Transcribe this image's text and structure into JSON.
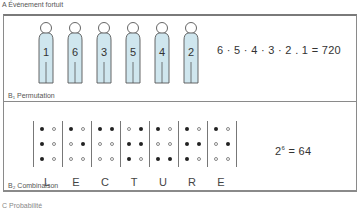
{
  "section_a": {
    "label": "A   Événement fortuit"
  },
  "permutation": {
    "label": "B₁  Permutation",
    "figures": [
      {
        "number": "1",
        "x": 35
      },
      {
        "number": "6",
        "x": 64
      },
      {
        "number": "3",
        "x": 93
      },
      {
        "number": "5",
        "x": 122
      },
      {
        "number": "4",
        "x": 151
      },
      {
        "number": "2",
        "x": 180
      }
    ],
    "formula": "6 · 5 · 4 · 3 · 2 . 1 = 720",
    "figure_color": "#cfe6ee"
  },
  "combination": {
    "label": "B₂  Combinaison",
    "formula_base": "2",
    "formula_exp": "6",
    "formula_rest": " = 64",
    "letters": [
      {
        "letter": "L",
        "dots": [
          [
            1,
            0
          ],
          [
            1,
            0
          ],
          [
            1,
            0
          ]
        ]
      },
      {
        "letter": "E",
        "dots": [
          [
            1,
            0
          ],
          [
            0,
            1
          ],
          [
            0,
            0
          ]
        ]
      },
      {
        "letter": "C",
        "dots": [
          [
            1,
            1
          ],
          [
            0,
            0
          ],
          [
            0,
            0
          ]
        ]
      },
      {
        "letter": "T",
        "dots": [
          [
            0,
            1
          ],
          [
            1,
            1
          ],
          [
            1,
            0
          ]
        ]
      },
      {
        "letter": "U",
        "dots": [
          [
            1,
            0
          ],
          [
            0,
            0
          ],
          [
            1,
            1
          ]
        ]
      },
      {
        "letter": "R",
        "dots": [
          [
            1,
            0
          ],
          [
            1,
            1
          ],
          [
            1,
            0
          ]
        ]
      },
      {
        "letter": "E",
        "dots": [
          [
            1,
            0
          ],
          [
            0,
            1
          ],
          [
            0,
            0
          ]
        ]
      }
    ]
  },
  "section_c": {
    "label": "C   Probabilité"
  }
}
